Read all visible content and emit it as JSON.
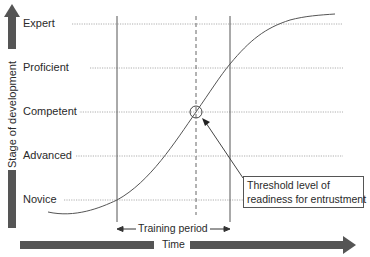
{
  "diagram": {
    "y_axis_title": "Stage of development",
    "x_axis_title": "Time",
    "levels": [
      {
        "label": "Expert",
        "y": 24
      },
      {
        "label": "Proficient",
        "y": 68
      },
      {
        "label": "Competent",
        "y": 112
      },
      {
        "label": "Advanced",
        "y": 156
      },
      {
        "label": "Novice",
        "y": 200
      }
    ],
    "training_period_label": "Training period",
    "callout_text_line1": "Threshold level of",
    "callout_text_line2": "readiness for entrustment",
    "colors": {
      "arrow": "#555555",
      "line": "#555555",
      "gridline": "#9a9a9a",
      "text": "#2a2a2a"
    }
  }
}
